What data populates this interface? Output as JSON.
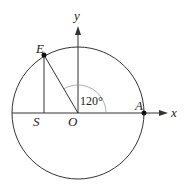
{
  "diagram": {
    "type": "unit-circle-angle",
    "labels": {
      "x_axis": "x",
      "y_axis": "y",
      "origin": "O",
      "point_E": "E",
      "point_A": "A",
      "point_S": "S",
      "angle": "120°"
    },
    "colors": {
      "stroke": "#333333",
      "arc": "#999999",
      "text": "#222222"
    }
  }
}
